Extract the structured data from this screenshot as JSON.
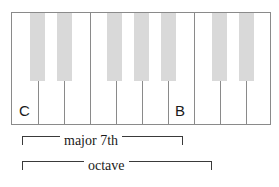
{
  "figure": {
    "type": "piano-keyboard-interval-diagram",
    "caption": null,
    "colors": {
      "black_key_fill": "#d9d9d9",
      "outline": "#8a8a8a",
      "bracket": "#3a3a3a",
      "text": "#1a1a1a",
      "background": "#ffffff"
    },
    "keyboard": {
      "white_key_count": 10,
      "white_keys": [
        {
          "index": 0,
          "note": "C",
          "label": "C"
        },
        {
          "index": 1,
          "note": "D",
          "label": ""
        },
        {
          "index": 2,
          "note": "E",
          "label": ""
        },
        {
          "index": 3,
          "note": "F",
          "label": ""
        },
        {
          "index": 4,
          "note": "G",
          "label": ""
        },
        {
          "index": 5,
          "note": "A",
          "label": ""
        },
        {
          "index": 6,
          "note": "B",
          "label": "B"
        },
        {
          "index": 7,
          "note": "C",
          "label": ""
        },
        {
          "index": 8,
          "note": "D",
          "label": ""
        },
        {
          "index": 9,
          "note": "E",
          "label": ""
        }
      ],
      "black_key_count": 7,
      "black_keys": [
        {
          "index": 0,
          "note": "C#"
        },
        {
          "index": 1,
          "note": "D#"
        },
        {
          "index": 2,
          "note": "F#"
        },
        {
          "index": 3,
          "note": "G#"
        },
        {
          "index": 4,
          "note": "A#"
        },
        {
          "index": 5,
          "note": "C#"
        },
        {
          "index": 6,
          "note": "D#"
        }
      ]
    },
    "labels": {
      "c_label": "C",
      "b_label": "B"
    },
    "brackets": [
      {
        "id": "major-7th",
        "label": "major 7th",
        "from_note": "C",
        "to_note": "B"
      },
      {
        "id": "octave",
        "label": "octave",
        "from_note": "C",
        "to_note": "C"
      }
    ]
  }
}
